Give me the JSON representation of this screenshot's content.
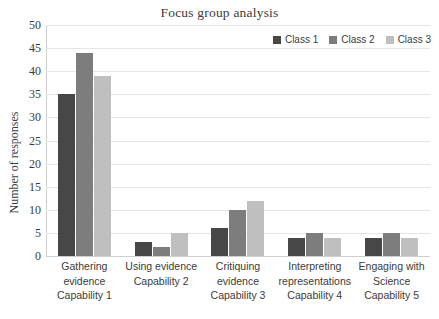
{
  "chart_data": {
    "type": "bar",
    "title": "Focus group analysis",
    "xlabel": "",
    "ylabel": "Number of responses",
    "ylim": [
      0,
      50
    ],
    "ytick_step": 5,
    "yticks": [
      50,
      45,
      40,
      35,
      30,
      25,
      20,
      15,
      10,
      5,
      0
    ],
    "grid": true,
    "legend_position": "top-right",
    "categories": [
      "Gathering evidence Capability 1",
      "Using evidence Capability 2",
      "Critiquing evidence Capability 3",
      "Interpreting representations Capability 4",
      "Engaging with Science Capability 5"
    ],
    "category_lines": [
      [
        "Gathering",
        "evidence",
        "Capability 1"
      ],
      [
        "Using evidence",
        "Capability 2",
        ""
      ],
      [
        "Critiquing",
        "evidence",
        "Capability 3"
      ],
      [
        "Interpreting",
        "representations",
        "Capability 4"
      ],
      [
        "Engaging with",
        "Science",
        "Capability 5"
      ]
    ],
    "series": [
      {
        "name": "Class 1",
        "color": "#474747",
        "values": [
          35,
          3,
          6,
          4,
          4
        ]
      },
      {
        "name": "Class 2",
        "color": "#7d7d7d",
        "values": [
          44,
          2,
          10,
          5,
          5
        ]
      },
      {
        "name": "Class 3",
        "color": "#bfbfbf",
        "values": [
          39,
          5,
          12,
          4,
          4
        ]
      }
    ]
  },
  "colors": {
    "background": "#ffffff",
    "gridline": "#e6e6e6",
    "axis": "#cfcfcf",
    "text": "#3b3b3b"
  }
}
